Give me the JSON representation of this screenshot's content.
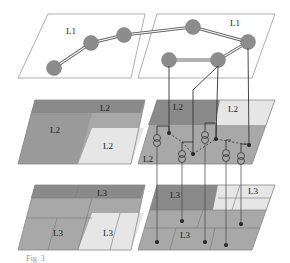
{
  "diagram": {
    "layers": [
      {
        "id": "L1",
        "labels": [
          "L1",
          "L1"
        ],
        "description": "top plane with node network"
      },
      {
        "id": "L2",
        "labels": [
          "L2",
          "L2",
          "L2",
          "L2",
          "L2",
          "L2"
        ],
        "description": "middle plane with shaded regions and current-source symbols"
      },
      {
        "id": "L3",
        "labels": [
          "L3",
          "L3",
          "L3",
          "L3",
          "L3"
        ],
        "description": "bottom plane with grid regions"
      }
    ],
    "colors": {
      "plane_border": "#888888",
      "dark_region": "#8a8a8a",
      "mid_region": "#a8a8a8",
      "light_region": "#e6e6e6",
      "node_fill": "#8c8c8c",
      "connector": "#333333"
    },
    "caption": "Fig. 3"
  }
}
